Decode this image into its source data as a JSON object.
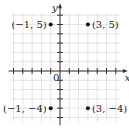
{
  "chart_data": {
    "type": "scatter",
    "title": "",
    "xlabel": "x",
    "ylabel": "y",
    "origin_label": "0",
    "xlim": [
      -5,
      6
    ],
    "ylim": [
      -5,
      6
    ],
    "grid": true,
    "points": [
      {
        "x": -1,
        "y": 5,
        "label": "(−1, 5)"
      },
      {
        "x": 3,
        "y": 5,
        "label": "(3, 5)"
      },
      {
        "x": -1,
        "y": -4,
        "label": "(−1, −4)"
      },
      {
        "x": 3,
        "y": -4,
        "label": "(3, −4)"
      }
    ]
  },
  "colors": {
    "grid": "#dcdcdc",
    "axis": "#333333",
    "point": "#111111"
  }
}
